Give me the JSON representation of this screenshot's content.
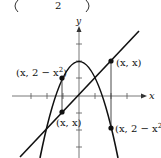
{
  "diagram": {
    "header_fragment": {
      "left_paren": "(",
      "fraction_denominator": "2",
      "right_paren": ")"
    },
    "axes": {
      "x_label": "x",
      "y_label": "y"
    },
    "curves": [
      {
        "name": "parabola",
        "equation": "y = 2 - x^2"
      },
      {
        "name": "line",
        "equation": "y = x"
      }
    ],
    "points": [
      {
        "id": "left-parabola-point",
        "label": "(x, 2 − x²)",
        "label_main": "(x, 2 − x",
        "label_sup": "2",
        "label_close": ")"
      },
      {
        "id": "left-line-point",
        "label": "(x, x)"
      },
      {
        "id": "right-line-point",
        "label": "(x, x)"
      },
      {
        "id": "right-parabola-point",
        "label": "(x, 2 − x²)",
        "label_main": "(x, 2 − x",
        "label_sup": "2",
        "label_close": ")"
      }
    ],
    "colors": {
      "stroke": "#111111",
      "axis": "#555555",
      "background": "#ffffff"
    }
  }
}
